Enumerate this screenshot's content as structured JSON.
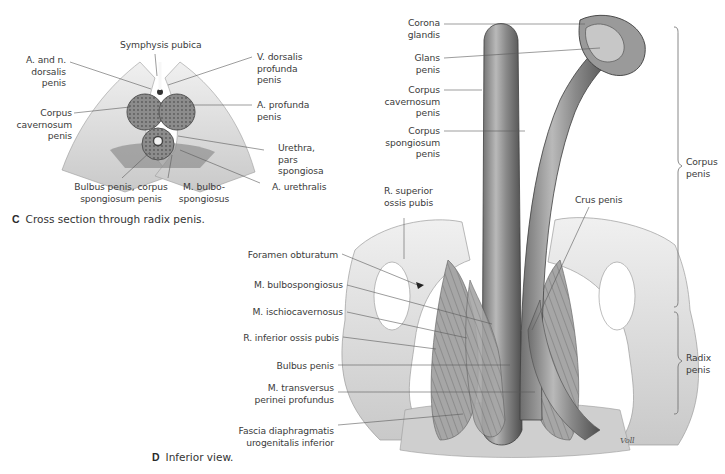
{
  "figure_c": {
    "letter": "C",
    "caption": "Cross section through radix penis.",
    "labels": {
      "symphysis": "Symphysis pubica",
      "a_n_dorsalis": [
        "A. and n.",
        "dorsalis",
        "penis"
      ],
      "corpus_cavernosum": [
        "Corpus",
        "cavernosum",
        "penis"
      ],
      "bulbus": [
        "Bulbus penis, corpus",
        "spongiosum penis"
      ],
      "m_bulbo": [
        "M. bulbo-",
        "spongiosus"
      ],
      "v_dorsalis": [
        "V. dorsalis",
        "profunda",
        "penis"
      ],
      "a_profunda": [
        "A. profunda",
        "penis"
      ],
      "urethra": [
        "Urethra,",
        "pars",
        "spongiosa"
      ],
      "a_urethralis": "A. urethralis"
    }
  },
  "figure_d": {
    "letter": "D",
    "caption": "Inferior view.",
    "labels": {
      "corona": [
        "Corona",
        "glandis"
      ],
      "glans": [
        "Glans",
        "penis"
      ],
      "corpus_cav": [
        "Corpus",
        "cavernosum",
        "penis"
      ],
      "corpus_spong": [
        "Corpus",
        "spongiosum",
        "penis"
      ],
      "r_superior": [
        "R. superior",
        "ossis pubis"
      ],
      "crus": "Crus penis",
      "foramen": "Foramen obturatum",
      "m_bulbosp": "M. bulbospongiosus",
      "m_ischio": "M. ischiocavernosus",
      "r_inferior": "R. inferior ossis pubis",
      "bulbus_penis": "Bulbus penis",
      "m_transversus": [
        "M. transversus",
        "perinei profundus"
      ],
      "fascia": [
        "Fascia diaphragmatis",
        "urogenitalis inferior"
      ],
      "brace_corpus": [
        "Corpus",
        "penis"
      ],
      "brace_radix": [
        "Radix",
        "penis"
      ],
      "signature": "Voll"
    }
  },
  "colors": {
    "text": "#3b3b3b",
    "leader": "#5a5a5a",
    "tissue_light": "#e6e6e6",
    "tissue_mid": "#a8a8a8",
    "tissue_dark": "#5c5c5c"
  }
}
